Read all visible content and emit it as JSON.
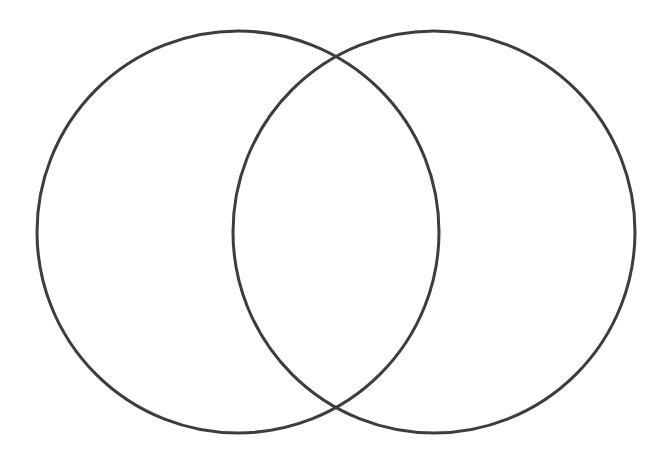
{
  "figure": {
    "type": "venn-diagram",
    "title": "",
    "caption": "",
    "background_color": "#ffffff",
    "width": 670,
    "height": 467
  },
  "chart_data": {
    "type": "diagram",
    "diagram_type": "venn",
    "title": "",
    "subtitle": "",
    "xlabel": "",
    "ylabel": "",
    "grid": false,
    "legend": "none",
    "annotations": [],
    "sets": [
      {
        "id": "set-a",
        "label": "",
        "center_x": 238,
        "center_y": 232,
        "radius": 201,
        "stroke_color": "#3d3d3d",
        "stroke_width": 3,
        "fill": "none",
        "count_label": ""
      },
      {
        "id": "set-b",
        "label": "",
        "center_x": 434,
        "center_y": 232,
        "radius": 201,
        "stroke_color": "#3d3d3d",
        "stroke_width": 3,
        "fill": "none",
        "count_label": ""
      }
    ],
    "intersection": {
      "label": "",
      "count_label": "",
      "upper_point_x": 336,
      "upper_point_y": 54,
      "lower_point_x": 336,
      "lower_point_y": 411
    }
  }
}
